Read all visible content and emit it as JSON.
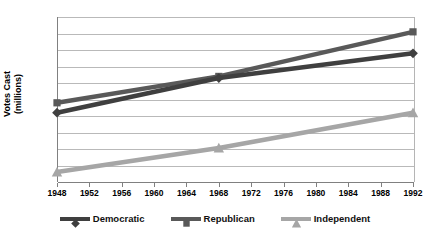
{
  "chart_data": {
    "type": "line",
    "title": "",
    "xlabel": "",
    "ylabel_line1": "Votes Cast",
    "ylabel_line2": "(millions)",
    "x": [
      1948,
      1968,
      1992
    ],
    "xlim": [
      1948,
      1992
    ],
    "ylim": [
      0,
      50
    ],
    "ytick_step": 5,
    "xtick_step": 4,
    "grid": true,
    "legend_position": "bottom",
    "xticks": [
      "1948",
      "1952",
      "1956",
      "1960",
      "1964",
      "1968",
      "1972",
      "1976",
      "1980",
      "1984",
      "1988",
      "1992"
    ],
    "yticks": [
      "0",
      "5",
      "10",
      "15",
      "20",
      "25",
      "30",
      "35",
      "40",
      "45",
      "50"
    ],
    "series": [
      {
        "name": "Democratic",
        "marker": "diamond",
        "color": "#3f3f3f",
        "values": [
          21,
          31.5,
          39
        ]
      },
      {
        "name": "Republican",
        "marker": "square",
        "color": "#595959",
        "values": [
          24,
          32,
          45.5
        ]
      },
      {
        "name": "Independent",
        "marker": "triangle",
        "color": "#a6a6a6",
        "values": [
          3,
          10.3,
          21
        ]
      }
    ]
  },
  "legend": {
    "items": [
      {
        "label": "Democratic"
      },
      {
        "label": "Republican"
      },
      {
        "label": "Independent"
      }
    ]
  },
  "axes": {
    "y_title_line1": "Votes Cast",
    "y_title_line2": "(millions)"
  }
}
